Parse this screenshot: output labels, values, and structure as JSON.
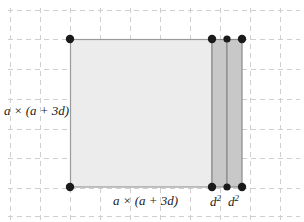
{
  "figure": {
    "background_color": "#ffffff",
    "width": 304,
    "height": 222
  },
  "grid": {
    "visible": true,
    "style": "dashed",
    "color": "#cfcfcf",
    "spacing_px": 30,
    "x_lines": [
      10,
      40,
      70,
      100,
      130,
      160,
      190,
      220,
      250,
      280
    ],
    "y_lines": [
      10,
      40,
      70,
      100,
      130,
      160,
      190,
      220
    ]
  },
  "shapes": {
    "main_square": {
      "name": "a-times-a-plus-3d-square",
      "fill": "#ececec",
      "stroke": "#9a9a9a",
      "x": 70,
      "y": 39,
      "width": 142,
      "height": 148
    },
    "band_1": {
      "name": "d-squared-band-left",
      "fill": "#c8c8c8",
      "stroke": "#8a8a8a",
      "x": 212,
      "y": 39,
      "width": 15,
      "height": 148
    },
    "band_2": {
      "name": "d-squared-band-right",
      "fill": "#c8c8c8",
      "stroke": "#8a8a8a",
      "x": 227,
      "y": 39,
      "width": 15,
      "height": 148
    }
  },
  "vertices": {
    "color": "#1a1a1a",
    "radius": 4,
    "points": [
      {
        "name": "top-left",
        "x": 70,
        "y": 39
      },
      {
        "name": "bottom-left",
        "x": 70,
        "y": 187
      },
      {
        "name": "top-band1-left",
        "x": 212,
        "y": 39
      },
      {
        "name": "top-band1-right",
        "x": 227,
        "y": 39
      },
      {
        "name": "top-band2-right",
        "x": 242,
        "y": 39
      },
      {
        "name": "bottom-band1-left",
        "x": 212,
        "y": 187
      },
      {
        "name": "bottom-band1-right",
        "x": 227,
        "y": 187
      },
      {
        "name": "bottom-band2-right",
        "x": 242,
        "y": 187
      }
    ]
  },
  "labels": {
    "left_area": {
      "base": "a",
      "operator": "×",
      "expression": "(a + 3d)",
      "full": "a × (a + 3d)"
    },
    "bottom_area": {
      "base": "a",
      "operator": "×",
      "expression": "(a + 3d)",
      "full": "a × (a + 3d)"
    },
    "d_square_1": {
      "base": "d",
      "exponent": "2",
      "full": "d²"
    },
    "d_square_2": {
      "base": "d",
      "exponent": "2",
      "full": "d²"
    }
  }
}
